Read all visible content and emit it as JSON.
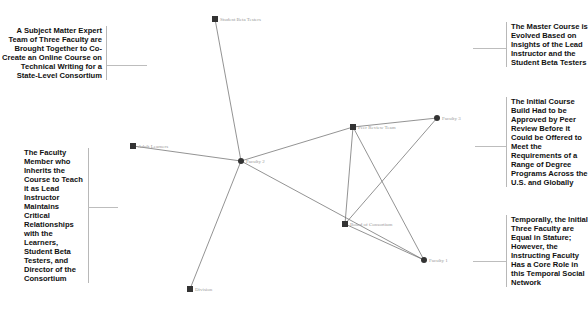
{
  "annotations": {
    "top_left": "A Subject Matter Expert Team of Three Faculty are Brought Together to Co-Create an Online Course on Technical Writing for a State-Level Consortium",
    "mid_left": "The Faculty Member who Inherits the Course to Teach it as Lead Instructor Maintains Critical Relationships with the Learners, Student Beta Testers, and Director of the Consortium",
    "top_right": "The Master Course is Evolved Based on Insights of the Lead Instructor and the Student Beta Testers",
    "mid_right": "The Initial Course Build Had to be Approved by Peer Review Before it Could be Offered to Meet the Requirements of a Range of Degree Programs Across the U.S. and Globally",
    "bottom_right": "Temporally, the Initial Three Faculty are Equal in Stature; However, the Instructing Faculty Has a Core Role in this Temporal Social Network"
  },
  "graph": {
    "nodes": [
      {
        "id": "student_beta_testers",
        "label": "Student Beta Testers",
        "shape": "square",
        "x": 215,
        "y": 19
      },
      {
        "id": "adult_learners",
        "label": "Adult Learners",
        "shape": "square",
        "x": 133,
        "y": 146
      },
      {
        "id": "faculty_2",
        "label": "Faculty 2",
        "shape": "circle",
        "x": 241,
        "y": 161
      },
      {
        "id": "peer_review_team",
        "label": "Peer Review Team",
        "shape": "square",
        "x": 353,
        "y": 127
      },
      {
        "id": "faculty_3",
        "label": "Faculty 3",
        "shape": "circle",
        "x": 437,
        "y": 118
      },
      {
        "id": "board_of_consortium",
        "label": "Board of Consortium",
        "shape": "square",
        "x": 345,
        "y": 224
      },
      {
        "id": "faculty_1",
        "label": "Faculty 1",
        "shape": "circle",
        "x": 424,
        "y": 260
      },
      {
        "id": "division",
        "label": "Division",
        "shape": "square",
        "x": 190,
        "y": 289
      }
    ],
    "edges": [
      [
        "student_beta_testers",
        "faculty_2"
      ],
      [
        "adult_learners",
        "faculty_2"
      ],
      [
        "faculty_2",
        "peer_review_team"
      ],
      [
        "faculty_2",
        "faculty_1"
      ],
      [
        "faculty_2",
        "division"
      ],
      [
        "peer_review_team",
        "faculty_3"
      ],
      [
        "peer_review_team",
        "faculty_1"
      ],
      [
        "faculty_3",
        "board_of_consortium"
      ],
      [
        "peer_review_team",
        "board_of_consortium"
      ],
      [
        "board_of_consortium",
        "faculty_1"
      ]
    ]
  },
  "colors": {
    "node": "#333333",
    "edge": "#777777",
    "label": "#9a9a9a",
    "annotation_text": "#111111"
  }
}
